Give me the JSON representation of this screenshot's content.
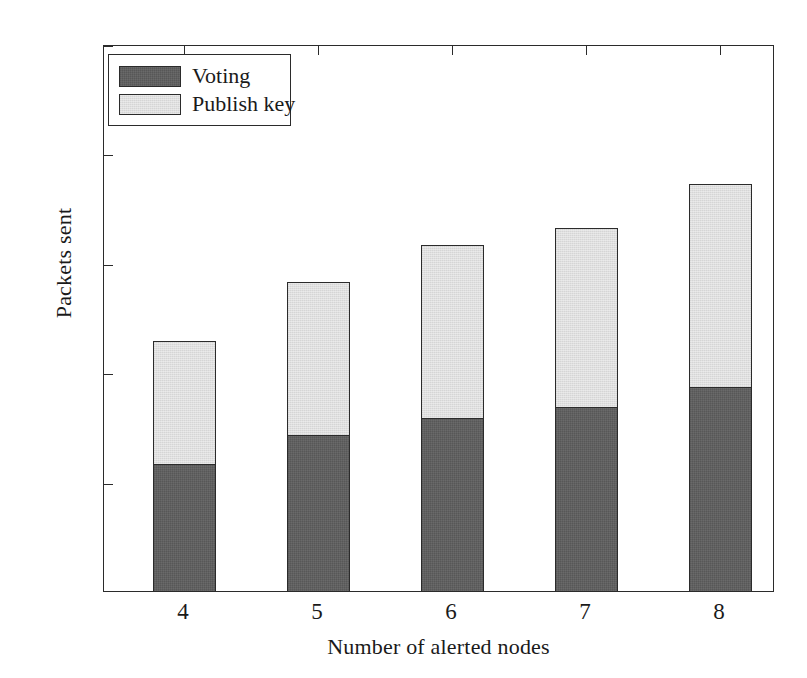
{
  "chart_data": {
    "type": "bar",
    "subtype": "stacked",
    "title": "",
    "xlabel": "Number of alerted nodes",
    "ylabel": "Packets sent",
    "categories": [
      "4",
      "5",
      "6",
      "7",
      "8"
    ],
    "series": [
      {
        "name": "Voting",
        "color": "#5c5c5c",
        "values": [
          5.9,
          7.2,
          8.0,
          8.5,
          9.4
        ]
      },
      {
        "name": "Publish key",
        "color": "#dddddd",
        "values": [
          5.7,
          7.1,
          8.0,
          8.3,
          9.4
        ]
      }
    ],
    "totals": [
      11.6,
      14.3,
      16.0,
      16.8,
      18.8
    ],
    "ylim": [
      0,
      25
    ],
    "xlim": [
      3.5,
      8.5
    ],
    "yticks": [
      0,
      5,
      10,
      15,
      20,
      25
    ],
    "ytick_labels": [
      "0",
      "5",
      "10",
      "15",
      "20",
      "25"
    ],
    "xtick_labels": [
      "4",
      "5",
      "6",
      "7",
      "8"
    ],
    "grid": false,
    "legend_position": "upper left",
    "legend_entries": [
      "Voting",
      "Publish key"
    ]
  },
  "axes": {
    "y_label": "Packets sent",
    "x_label": "Number of alerted nodes",
    "y_ticks": [
      {
        "label": "25",
        "value": 25
      },
      {
        "label": "20",
        "value": 20
      },
      {
        "label": "15",
        "value": 15
      },
      {
        "label": "10",
        "value": 10
      },
      {
        "label": "5",
        "value": 5
      },
      {
        "label": "0",
        "value": 0
      }
    ],
    "x_ticks": [
      {
        "label": "4",
        "value": 4
      },
      {
        "label": "5",
        "value": 5
      },
      {
        "label": "6",
        "value": 6
      },
      {
        "label": "7",
        "value": 7
      },
      {
        "label": "8",
        "value": 8
      }
    ]
  },
  "legend": {
    "items": [
      {
        "label": "Voting",
        "color": "#5c5c5c"
      },
      {
        "label": "Publish key",
        "color": "#dddddd"
      }
    ]
  },
  "artifact": {
    "mark": ""
  }
}
